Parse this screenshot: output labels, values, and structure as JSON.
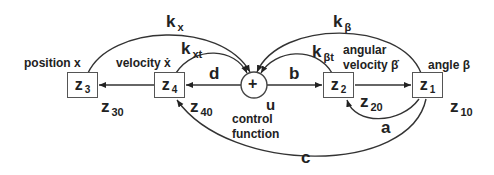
{
  "diagram": {
    "nodes": [
      {
        "id": "z3",
        "main": "z",
        "sub": "3",
        "label": "position x",
        "init": {
          "main": "z",
          "sub": "30"
        }
      },
      {
        "id": "z4",
        "main": "z",
        "sub": "4",
        "label": "velocity ẋ",
        "init": {
          "main": "z",
          "sub": "40"
        }
      },
      {
        "id": "sum",
        "symbol": "+",
        "output": "u",
        "label_line1": "control",
        "label_line2": "function"
      },
      {
        "id": "z2",
        "main": "z",
        "sub": "2",
        "label_line1": "angular",
        "label_line2": "velocity β̇",
        "init": {
          "main": "z",
          "sub": "20"
        }
      },
      {
        "id": "z1",
        "main": "z",
        "sub": "1",
        "label": "angle β",
        "init": {
          "main": "z",
          "sub": "10"
        }
      }
    ],
    "edges": [
      {
        "from": "z4",
        "to": "z3",
        "label": ""
      },
      {
        "from": "sum",
        "to": "z4",
        "label": "d"
      },
      {
        "from": "sum",
        "to": "z2",
        "label": "b"
      },
      {
        "from": "z2",
        "to": "z1",
        "label": ""
      },
      {
        "from": "z1",
        "to": "z2",
        "label": "a"
      },
      {
        "from": "z1",
        "to": "z4",
        "label": "c"
      },
      {
        "from": "z3",
        "to": "sum",
        "label": {
          "main": "k",
          "sub": "x"
        }
      },
      {
        "from": "z4",
        "to": "sum",
        "label": {
          "main": "k",
          "sub": "xt"
        }
      },
      {
        "from": "z1",
        "to": "sum",
        "label": {
          "main": "k",
          "sub": "β"
        }
      },
      {
        "from": "z2",
        "to": "sum",
        "label": {
          "main": "k",
          "sub": "βt"
        }
      }
    ]
  }
}
